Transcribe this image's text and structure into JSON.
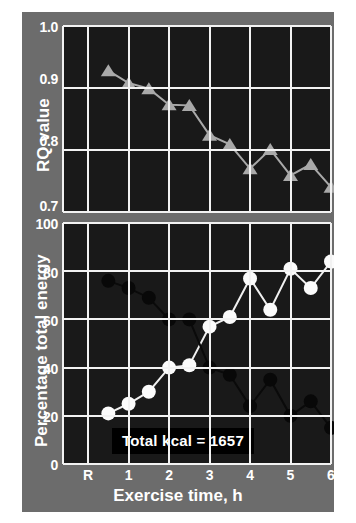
{
  "figure": {
    "background_color": "#6c6c6c",
    "plot_background_color": "#191919",
    "grid_color": "#f2f2f2"
  },
  "annotation": {
    "kcal_text": "Total kcal = 1657"
  },
  "axes": {
    "x_label": "Exercise time, h",
    "x_ticks": [
      "R",
      "1",
      "2",
      "3",
      "4",
      "5",
      "6"
    ],
    "top_y_label": "RQ value",
    "top_y_ticks": [
      "1.0",
      "0.9",
      "0.8",
      "0.7"
    ],
    "bottom_y_label": "Percentage total energy",
    "bottom_y_ticks": [
      "100",
      "80",
      "60",
      "40",
      "20",
      "0"
    ]
  },
  "chart_data": [
    {
      "type": "line",
      "title": "",
      "xlabel": "Exercise time, h",
      "ylabel": "RQ value",
      "ylim": [
        0.7,
        1.0
      ],
      "xlim": [
        0,
        6.5
      ],
      "grid": true,
      "legend": "none",
      "marker": "triangle",
      "marker_color": "#a9a9a9",
      "x": [
        0.5,
        1.0,
        1.5,
        2.0,
        2.5,
        3.0,
        3.5,
        4.0,
        4.5,
        5.0,
        5.5,
        6.0
      ],
      "values": [
        0.928,
        0.908,
        0.899,
        0.873,
        0.872,
        0.824,
        0.809,
        0.77,
        0.801,
        0.759,
        0.777,
        0.74
      ]
    },
    {
      "type": "line",
      "title": "",
      "xlabel": "Exercise time, h",
      "ylabel": "Percentage total energy",
      "ylim": [
        0,
        100
      ],
      "xlim": [
        0,
        6.5
      ],
      "grid": true,
      "legend": "none",
      "x": [
        0.5,
        1.0,
        1.5,
        2.0,
        2.5,
        3.0,
        3.5,
        4.0,
        4.5,
        5.0,
        5.5,
        6.0
      ],
      "series": [
        {
          "name": "open-circles",
          "marker": "circle",
          "marker_color": "#fbfbfb",
          "values": [
            21,
            25,
            30,
            40,
            41,
            57,
            61,
            77,
            64,
            81,
            73,
            84
          ]
        },
        {
          "name": "filled-circles",
          "marker": "circle",
          "marker_color": "#080808",
          "values": [
            76,
            73,
            69,
            60,
            60,
            40,
            37,
            24,
            35,
            20,
            26,
            15
          ]
        }
      ]
    }
  ]
}
